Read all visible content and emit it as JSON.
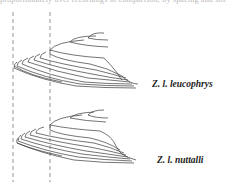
{
  "caption_fragment": "proportionately over recordings in comparison, by spacing and similar",
  "figure": {
    "type": "song-spectrogram-contour-comparison",
    "guides": {
      "style": "dashed",
      "count": 2,
      "color": "#888888"
    },
    "panels": [
      {
        "id": "upper",
        "label": "Z. l. leucophrys"
      },
      {
        "id": "lower",
        "label": "Z. l. nuttalli"
      }
    ]
  }
}
